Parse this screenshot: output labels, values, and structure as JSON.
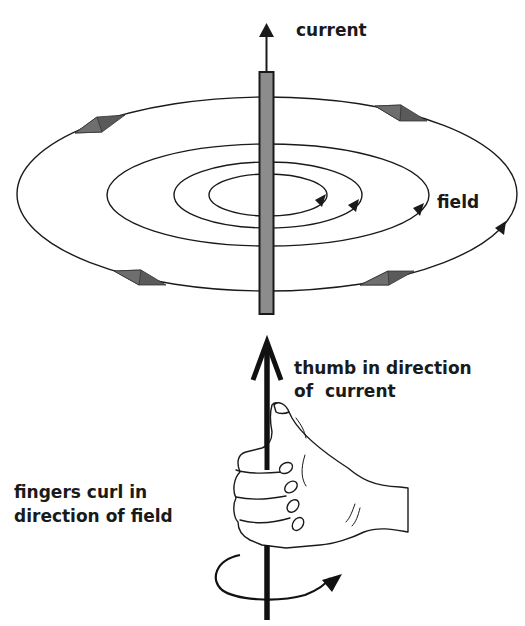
{
  "diagram": {
    "labels": {
      "current": "current",
      "field": "field",
      "thumb_line1": "thumb in direction",
      "thumb_line2": "of  current",
      "fingers_line1": "fingers curl in",
      "fingers_line2": "direction of field"
    },
    "elements": {
      "wire": "vertical conductor rod",
      "field_loops": 4,
      "current_arrow": "upward arrow",
      "hand": "right hand gripping wire, thumb up",
      "curl_arrow": "counter-clockwise rotation arrow"
    },
    "colors": {
      "line": "#1a1a1a",
      "rod_fill": "#8c8c8c",
      "marker_fill": "#5a5a5a",
      "background": "#ffffff"
    }
  }
}
